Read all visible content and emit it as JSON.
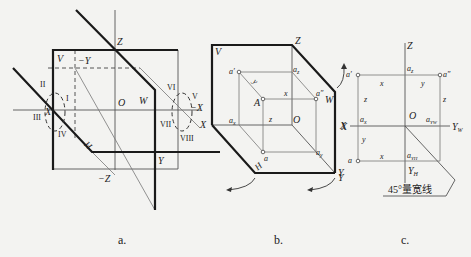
{
  "figure_a": {
    "caption": "a.",
    "plane_labels": {
      "V": "V",
      "W": "W",
      "H": "H"
    },
    "axis_labels": {
      "Z": "Z",
      "neg_Z": "−Z",
      "neg_Y": "−Y",
      "Y": "Y",
      "X": "X",
      "neg_X": "−X",
      "X_right": "X",
      "O": "O"
    },
    "octants": [
      "I",
      "II",
      "III",
      "IV",
      "V",
      "VI",
      "VII",
      "VIII"
    ]
  },
  "figure_b": {
    "caption": "b.",
    "plane_labels": {
      "V": "V",
      "W": "W",
      "H": "H"
    },
    "axis_labels": {
      "Z": "Z",
      "X": "X",
      "Y": "Y",
      "O": "O"
    },
    "point_labels": {
      "A": "A",
      "a_prime": "a′",
      "a_double_prime": "a″",
      "a": "a",
      "a_x": "a",
      "a_x_sub": "x",
      "a_z": "a",
      "a_z_sub": "z",
      "a_y": "a",
      "a_y_sub": "y"
    },
    "dim_labels": {
      "x": "x",
      "y": "y",
      "z": "z"
    }
  },
  "figure_c": {
    "caption": "c.",
    "axis_labels": {
      "Z": "Z",
      "X": "X",
      "Y_W": "Y",
      "Y_W_sub": "W",
      "Y_H": "Y",
      "Y_H_sub": "H",
      "Y_left": "Y",
      "O": "O"
    },
    "point_labels": {
      "a_prime": "a′",
      "a_double_prime": "a″",
      "a": "a",
      "a_z": "a",
      "a_z_sub": "z",
      "a_x": "a",
      "a_x_sub": "x",
      "a_YW": "a",
      "a_YW_sub": "YW",
      "a_YH": "a",
      "a_YH_sub": "YH"
    },
    "dim_labels": {
      "x_top": "x",
      "y_top": "y",
      "z_left": "z",
      "z_right": "z",
      "y_left": "y",
      "x_bottom": "x"
    },
    "annotation": "45°量宽线"
  }
}
